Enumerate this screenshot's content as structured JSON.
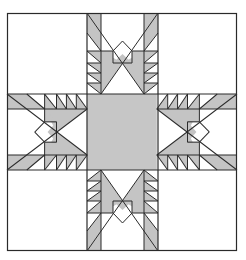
{
  "image": {
    "description": "Feathered star quilt block line drawing",
    "width": 246,
    "height": 260
  },
  "block": {
    "left": 7,
    "top": 13,
    "right": 237,
    "bottom": 251,
    "grid_x": [
      7,
      87,
      158,
      237
    ],
    "grid_y": [
      13,
      94,
      170,
      251
    ]
  },
  "colors": {
    "background": "#ffffff",
    "shade": "#c4c4c4",
    "line": "#2a2a2a",
    "center": "#c6c6c6"
  },
  "units": [
    "top-point",
    "right-point",
    "bottom-point",
    "left-point"
  ]
}
